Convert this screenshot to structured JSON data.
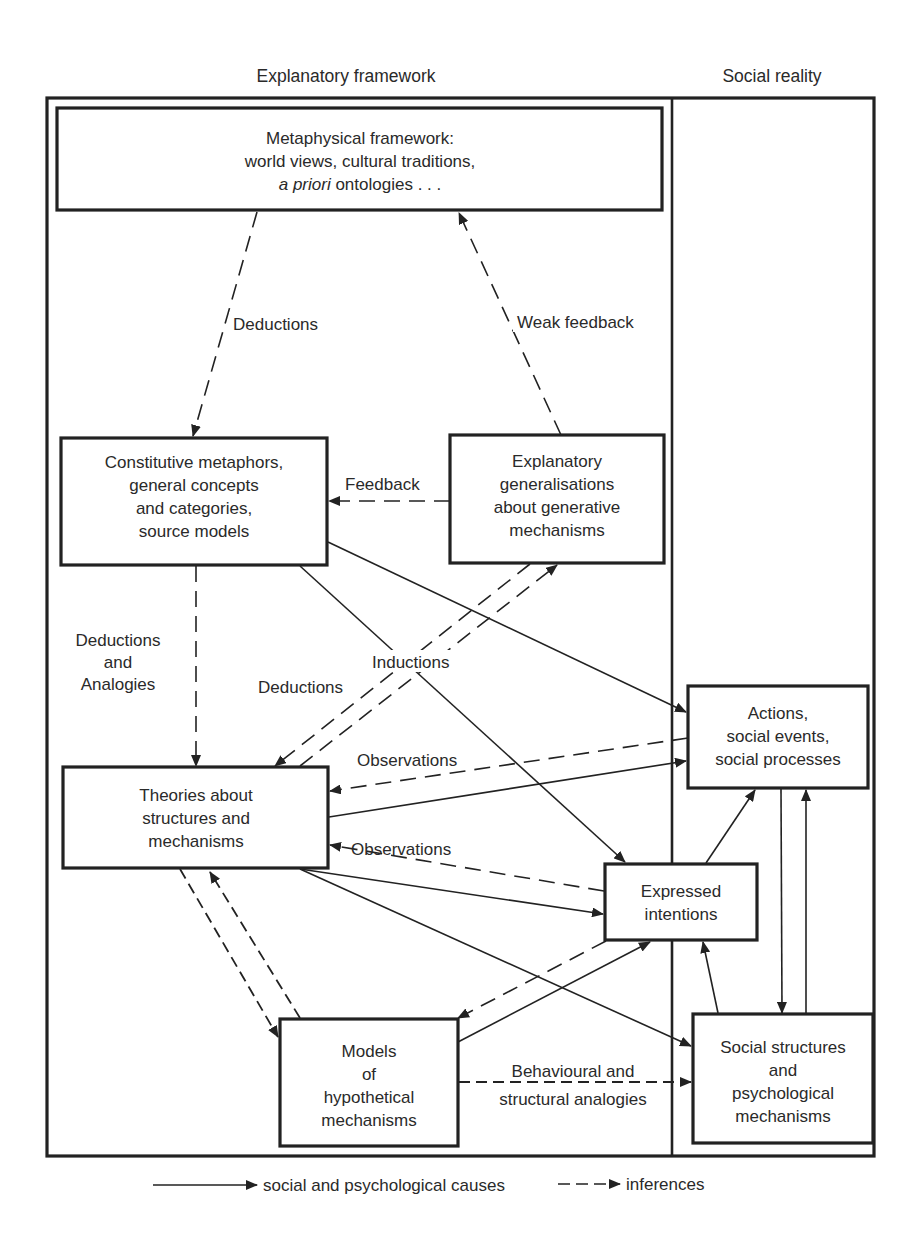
{
  "headers": {
    "left": "Explanatory framework",
    "right": "Social reality"
  },
  "boxes": {
    "metaphysical": {
      "line1": "Metaphysical framework:",
      "line2": "world views, cultural traditions,",
      "line3_italic": "a priori",
      "line3_rest": " ontologies . . ."
    },
    "constitutive": {
      "lines": [
        "Constitutive metaphors,",
        "general concepts",
        "and categories,",
        "source models"
      ]
    },
    "explanatory": {
      "lines": [
        "Explanatory",
        "generalisations",
        "about generative",
        "mechanisms"
      ]
    },
    "theories": {
      "lines": [
        "Theories about",
        "structures and",
        "mechanisms"
      ]
    },
    "models": {
      "lines": [
        "Models",
        "of",
        "hypothetical",
        "mechanisms"
      ]
    },
    "actions": {
      "lines": [
        "Actions,",
        "social events,",
        "social processes"
      ]
    },
    "expressed": {
      "lines": [
        "Expressed",
        "intentions"
      ]
    },
    "social_structures": {
      "lines": [
        "Social structures",
        "and",
        "psychological",
        "mechanisms"
      ]
    }
  },
  "edge_labels": {
    "deductions_top": "Deductions",
    "weak_feedback": "Weak feedback",
    "feedback": "Feedback",
    "deductions_analogies": [
      "Deductions",
      "and",
      "Analogies"
    ],
    "deductions_mid": "Deductions",
    "inductions": "Inductions",
    "observations_upper": "Observations",
    "observations_lower": "Observations",
    "behavioural": [
      "Behavioural and",
      "structural analogies"
    ]
  },
  "legend": {
    "solid_label": "social and psychological causes",
    "dashed_label": "inferences"
  }
}
